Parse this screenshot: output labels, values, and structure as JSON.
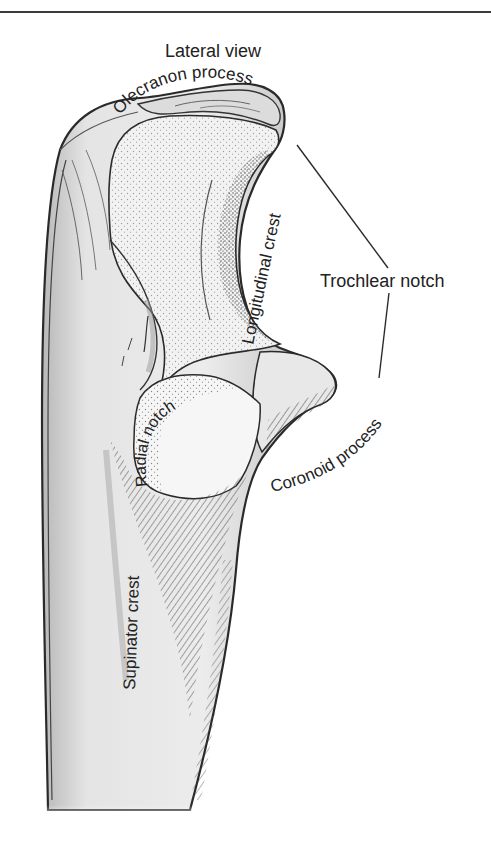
{
  "figure": {
    "view_title": "Lateral view",
    "labels": {
      "olecranon": "Olecranon process",
      "longitudinal_crest": "Longitudinal crest",
      "trochlear_notch": "Trochlear notch",
      "radial_notch": "Radial notch",
      "coronoid": "Coronoid process",
      "supinator_crest": "Supinator crest"
    },
    "colors": {
      "outline": "#2a2a2a",
      "bone_fill": "#e6e6e6",
      "shade": "#9a9a9a",
      "articular": "#f4f4f4",
      "text": "#222222"
    }
  }
}
